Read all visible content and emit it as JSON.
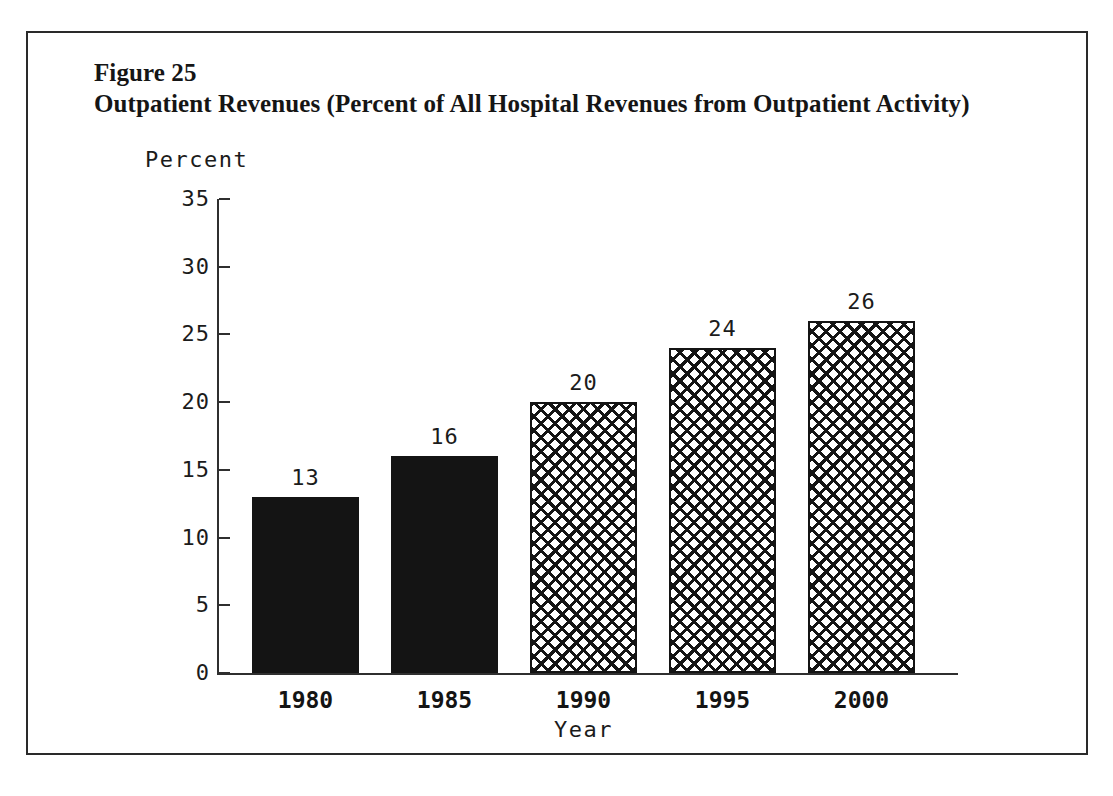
{
  "figure": {
    "number_label": "Figure 25",
    "caption": "Outpatient Revenues (Percent of All Hospital Revenues from Outpatient Activity)"
  },
  "chart_data": {
    "type": "bar",
    "title": "Outpatient Revenues (Percent of All Hospital Revenues from Outpatient Activity)",
    "categories": [
      "1980",
      "1985",
      "1990",
      "1995",
      "2000"
    ],
    "values": [
      13,
      16,
      20,
      24,
      26
    ],
    "value_labels": [
      "13",
      "16",
      "20",
      "24",
      "26"
    ],
    "xlabel": "Year",
    "ylabel": "Percent",
    "ylim": [
      0,
      35
    ],
    "yticks": [
      0,
      5,
      10,
      15,
      20,
      25,
      30,
      35
    ],
    "ytick_labels": [
      "0",
      "5",
      "10",
      "15",
      "20",
      "25",
      "30",
      "35"
    ],
    "grid": false,
    "legend": null,
    "series_styles": [
      "solid",
      "solid",
      "crosshatch",
      "crosshatch",
      "crosshatch"
    ],
    "colors": {
      "bar_solid": "#141414",
      "bar_hatch_line": "#141414",
      "bar_hatch_background": "#ffffff",
      "axis": "#2f2f2f",
      "text": "#1b1b1b",
      "frame": "#2a2a2a",
      "background": "#ffffff"
    }
  }
}
